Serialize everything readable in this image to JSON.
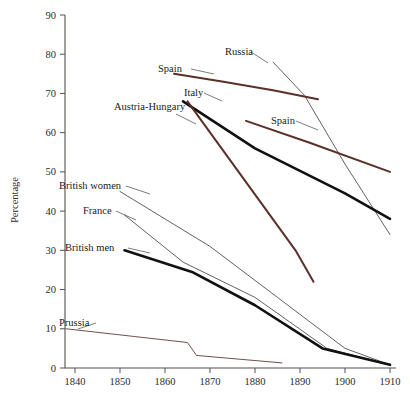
{
  "axes": {
    "ylabel": "Percentage",
    "xlabel": "",
    "ylim": [
      0,
      90
    ],
    "xlim": [
      1835,
      1912
    ],
    "yticks": [
      0,
      10,
      20,
      30,
      40,
      50,
      60,
      70,
      80,
      90
    ],
    "xticks": [
      1840,
      1850,
      1860,
      1870,
      1880,
      1890,
      1900,
      1910
    ],
    "ytick_labels": [
      "0",
      "10",
      "20",
      "30",
      "40",
      "50",
      "60",
      "70",
      "80",
      "90"
    ],
    "xtick_labels": [
      "1840",
      "1850",
      "1860",
      "1870",
      "1880",
      "1890",
      "1900",
      "1910"
    ],
    "grid": false,
    "legend_position": "inline-annotations"
  },
  "colors": {
    "brown": "#5a3028",
    "black": "#111111",
    "thin_grey": "#4a4442",
    "axis": "#55504c"
  },
  "chart_data": {
    "type": "line",
    "title": "",
    "xlabel": "",
    "ylabel": "Percentage",
    "xlim": [
      1835,
      1912
    ],
    "ylim": [
      0,
      90
    ],
    "grid": false,
    "legend_position": "inline-annotations",
    "series": [
      {
        "name": "Spain",
        "color": "#5a3028",
        "style": "thick-brown",
        "label_positions": [
          "left",
          "mid-right"
        ],
        "x": [
          1862,
          1873,
          1884,
          1894
        ],
        "y": [
          75.0,
          73.0,
          70.8,
          68.5
        ]
      },
      {
        "name": "Russia",
        "color": "#4a4442",
        "style": "thin",
        "x": [
          1884,
          1891,
          1900,
          1910
        ],
        "y": [
          78.0,
          69.5,
          52.0,
          34.0
        ]
      },
      {
        "name": "Italy",
        "color": "#111111",
        "style": "thick-black",
        "x": [
          1864,
          1880,
          1900,
          1910
        ],
        "y": [
          68.0,
          56.0,
          44.5,
          38.0
        ]
      },
      {
        "name": "Spain (lower)",
        "color": "#5a3028",
        "style": "thick-brown",
        "x": [
          1878,
          1892,
          1910
        ],
        "y": [
          63.0,
          57.5,
          50.0
        ]
      },
      {
        "name": "Austria-Hungary",
        "color": "#5a3028",
        "style": "thick-brown",
        "x": [
          1865,
          1889,
          1893
        ],
        "y": [
          68.0,
          30.0,
          22.0
        ]
      },
      {
        "name": "British women",
        "color": "#4a4442",
        "style": "thin",
        "x": [
          1850,
          1870,
          1885,
          1900,
          1910
        ],
        "y": [
          45.0,
          31.0,
          18.0,
          5.0,
          0.8
        ]
      },
      {
        "name": "France",
        "color": "#4a4442",
        "style": "thin",
        "x": [
          1851,
          1864,
          1880,
          1896,
          1910
        ],
        "y": [
          39.0,
          27.0,
          18.0,
          5.0,
          0.8
        ]
      },
      {
        "name": "British men",
        "color": "#111111",
        "style": "thick-black",
        "x": [
          1851,
          1866,
          1880,
          1895,
          1910
        ],
        "y": [
          30.0,
          24.5,
          16.0,
          5.0,
          0.8
        ]
      },
      {
        "name": "Prussia",
        "color": "#5a3028",
        "style": "thin-brown",
        "x": [
          1838,
          1865,
          1867,
          1886
        ],
        "y": [
          10.0,
          6.5,
          3.2,
          1.3
        ]
      }
    ],
    "annotations": [
      {
        "text": "Spain",
        "x": 158,
        "y": 72
      },
      {
        "text": "Russia",
        "x": 225,
        "y": 55
      },
      {
        "text": "Italy",
        "x": 184,
        "y": 96
      },
      {
        "text": "Austria-Hungary",
        "x": 114,
        "y": 110
      },
      {
        "text": "Spain",
        "x": 271,
        "y": 124
      },
      {
        "text": "British women",
        "x": 59,
        "y": 189
      },
      {
        "text": "France",
        "x": 83,
        "y": 214
      },
      {
        "text": "British men",
        "x": 65,
        "y": 251
      },
      {
        "text": "Prussia",
        "x": 59,
        "y": 326
      }
    ]
  }
}
